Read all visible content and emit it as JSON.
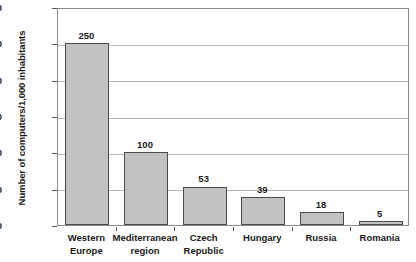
{
  "chart_data": {
    "type": "bar",
    "title": "",
    "subtitle": "",
    "xlabel": "",
    "ylabel": "Number of computers/1,000 inhabitants",
    "ylim": [
      0,
      300
    ],
    "yticks": [
      0,
      50,
      100,
      150,
      200,
      250,
      300
    ],
    "ytick_labels": [
      "0",
      "50",
      "100",
      "150",
      "200",
      "250",
      "300"
    ],
    "grid": true,
    "grid_axis": "y",
    "legend": false,
    "legend_position": "none",
    "categories": [
      "Western Europe",
      "Mediterranean region",
      "Czech Republic",
      "Hungary",
      "Russia",
      "Romania"
    ],
    "category_lines": [
      [
        "Western",
        "Europe"
      ],
      [
        "Mediterranean",
        "region"
      ],
      [
        "Czech",
        "Republic"
      ],
      [
        "Hungary",
        ""
      ],
      [
        "Russia",
        ""
      ],
      [
        "Romania",
        ""
      ]
    ],
    "values": [
      250,
      100,
      53,
      39,
      18,
      5
    ],
    "value_labels": [
      "250",
      "100",
      "53",
      "39",
      "18",
      "5"
    ],
    "bar_fill_color": "#c2c2c2",
    "bar_border_color": "#4a4a4a",
    "gridline_color": "#b9b9b9",
    "axis_color": "#8a8a8a",
    "background_color": "#ffffff",
    "text_color": "#1a1a1a"
  }
}
